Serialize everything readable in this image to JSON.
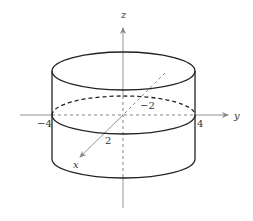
{
  "figure": {
    "type": "3d-cylinder-diagram",
    "axes": {
      "z": {
        "label": "z"
      },
      "y": {
        "label": "y",
        "ticks": [
          "-4",
          "4"
        ]
      },
      "x": {
        "label": "x",
        "ticks": [
          "2",
          "-2"
        ]
      }
    },
    "labels": {
      "z_axis": "z",
      "y_axis": "y",
      "x_axis": "x",
      "y_neg": "−4",
      "y_pos": "4",
      "x_pos": "2",
      "x_neg": "−2"
    },
    "colors": {
      "solid_line": "#222222",
      "axis_line": "#888888",
      "dashed_line": "#555555"
    }
  }
}
